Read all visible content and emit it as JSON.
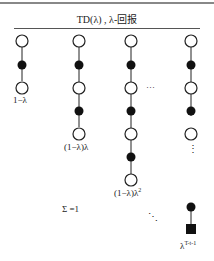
{
  "title": "TD(λ) , λ-回报",
  "columns": [
    {
      "x": 22,
      "nodes": [
        "open",
        "filled",
        "open"
      ],
      "weight_label": "1−λ"
    },
    {
      "x": 79,
      "nodes": [
        "open",
        "filled",
        "open",
        "filled",
        "open"
      ],
      "weight_label": "(1−λ)λ"
    },
    {
      "x": 131,
      "nodes": [
        "open",
        "filled",
        "open",
        "filled",
        "open",
        "filled",
        "open"
      ],
      "weight_label": "(1−λ)λ",
      "weight_exp": "2"
    },
    {
      "x": 191,
      "nodes": [
        "open",
        "filled",
        "open",
        "filled",
        "open"
      ],
      "tail": [
        "filled",
        "terminal-square"
      ],
      "weight_label": "λ",
      "weight_exp": "T-t-1"
    }
  ],
  "ellipsis_between": "…",
  "vertical_ellipsis": "⋮",
  "diagonal_ellipsis": "⋱",
  "sum_label": "Σ =1"
}
